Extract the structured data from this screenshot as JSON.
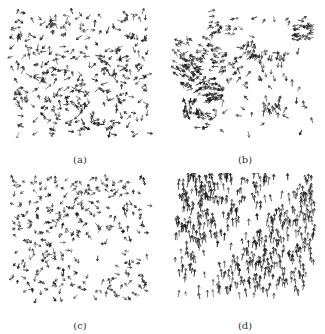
{
  "figure": {
    "panels": [
      {
        "id": "a",
        "label": "(a)",
        "x": 6,
        "y": 8,
        "w": 148,
        "h": 130,
        "cap_y": 146,
        "n": 340,
        "mode": "random",
        "seed": 11,
        "len": 5
      },
      {
        "id": "b",
        "label": "(b)",
        "x": 171,
        "y": 8,
        "w": 148,
        "h": 130,
        "cap_y": 146,
        "n": 360,
        "mode": "cluster",
        "seed": 23,
        "len": 5
      },
      {
        "id": "c",
        "label": "(c)",
        "x": 6,
        "y": 173,
        "w": 148,
        "h": 130,
        "cap_y": 147,
        "n": 300,
        "mode": "sparse",
        "seed": 37,
        "len": 4
      },
      {
        "id": "d",
        "label": "(d)",
        "x": 171,
        "y": 173,
        "w": 148,
        "h": 130,
        "cap_y": 147,
        "n": 520,
        "mode": "aligned",
        "seed": 53,
        "len": 6
      }
    ],
    "ink_color": "#1a1a1a"
  }
}
